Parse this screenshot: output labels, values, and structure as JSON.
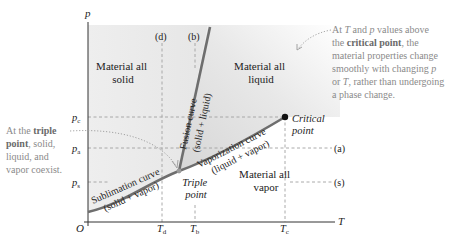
{
  "figure": {
    "axes": {
      "y_label": "p",
      "x_label": "T",
      "origin_label": "O",
      "y_ticks": [
        {
          "label": "p",
          "sub": "c"
        },
        {
          "label": "p",
          "sub": "a"
        },
        {
          "label": "p",
          "sub": "s"
        }
      ],
      "x_ticks": [
        {
          "label": "T",
          "sub": "d"
        },
        {
          "label": "T",
          "sub": "b"
        },
        {
          "label": "T",
          "sub": "c"
        }
      ]
    },
    "regions": {
      "solid": [
        "Material all",
        "solid"
      ],
      "liquid": [
        "Material all",
        "liquid"
      ],
      "vapor": [
        "Material all",
        "vapor"
      ]
    },
    "curves": {
      "fusion": {
        "name": "Fusion curve",
        "phases": "(solid + liquid)"
      },
      "vaporization": {
        "name": "Vaporization curve",
        "phases": "(liquid + vapor)"
      },
      "sublimation": {
        "name": "Sublimation curve",
        "phases": "(solid + vapor)"
      }
    },
    "points": {
      "triple": [
        "Triple",
        "point"
      ],
      "critical": [
        "Critical",
        "point"
      ]
    },
    "process_markers": {
      "a": "(a)",
      "s": "(s)",
      "d": "(d)",
      "b": "(b)"
    },
    "annotations": {
      "triple_note": {
        "line1_pre": "At the ",
        "line1_bold": "triple",
        "line2_bold": "point",
        "line2_post": ", solid,",
        "line3": "liquid, and",
        "line4": "vapor coexist."
      },
      "critical_note": {
        "line1_pre": "At ",
        "line1_T": "T",
        "line1_mid": " and ",
        "line1_p": "p",
        "line1_post": " values above",
        "line2_pre": "the ",
        "line2_bold": "critical point",
        "line2_post": ", the",
        "line3": "material properties change",
        "line4_pre": "smoothly with changing ",
        "line4_p": "p",
        "line5_pre": "or ",
        "line5_T": "T",
        "line5_post": ", rather than undergoing",
        "line6": "a phase change."
      }
    },
    "colors": {
      "curve": "#6e6e6e",
      "axis": "#333333",
      "solid_fill": "#ececec",
      "liquid_fill": "#dcdcdc",
      "dashed": "#a0a0a0",
      "note_text": "#8a8a8a",
      "critical_point": "#111111"
    }
  }
}
